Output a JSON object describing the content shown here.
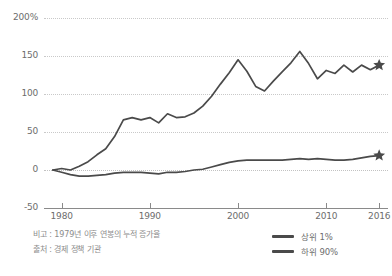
{
  "chart_data": {
    "type": "line",
    "title": "",
    "xlabel": "",
    "ylabel": "",
    "xlim": [
      1978,
      2017
    ],
    "ylim": [
      -50,
      200
    ],
    "grid": true,
    "legend_position": "bottom-right",
    "y_ticks": [
      "200%",
      "150",
      "100",
      "50",
      "0",
      "-50"
    ],
    "y_tick_values": [
      200,
      150,
      100,
      50,
      0,
      -50
    ],
    "x_ticks": [
      "1980",
      "1990",
      "2000",
      "2010",
      "2016"
    ],
    "x_tick_values": [
      1980,
      1990,
      2000,
      2010,
      2016
    ],
    "x": [
      1979,
      1980,
      1981,
      1982,
      1983,
      1984,
      1985,
      1986,
      1987,
      1988,
      1989,
      1990,
      1991,
      1992,
      1993,
      1994,
      1995,
      1996,
      1997,
      1998,
      1999,
      2000,
      2001,
      2002,
      2003,
      2004,
      2005,
      2006,
      2007,
      2008,
      2009,
      2010,
      2011,
      2012,
      2013,
      2014,
      2015,
      2016
    ],
    "series": [
      {
        "name": "상위 1%",
        "color": "#4a4a4a",
        "end_marker": "star",
        "values": [
          0,
          2,
          0,
          5,
          11,
          20,
          28,
          44,
          66,
          69,
          66,
          69,
          62,
          74,
          69,
          70,
          75,
          84,
          97,
          113,
          128,
          145,
          130,
          110,
          104,
          117,
          129,
          141,
          156,
          140,
          120,
          131,
          127,
          138,
          129,
          138,
          132,
          138
        ]
      },
      {
        "name": "하위 90%",
        "color": "#4a4a4a",
        "end_marker": "star",
        "values": [
          0,
          -3,
          -6,
          -8,
          -8,
          -7,
          -6,
          -4,
          -3,
          -3,
          -3,
          -4,
          -5,
          -3,
          -3,
          -2,
          0,
          1,
          4,
          7,
          10,
          12,
          13,
          13,
          13,
          13,
          13,
          14,
          15,
          14,
          15,
          14,
          13,
          13,
          14,
          16,
          18,
          19
        ]
      }
    ],
    "annotations": [
      {
        "name": "note",
        "text": "비고 : 1979년 이후 연봉의 누적 증가율"
      },
      {
        "name": "source",
        "text": "출처 : 경제 정책 기관"
      }
    ]
  },
  "legend": {
    "items": [
      {
        "label": "상위 1%",
        "color": "#4a4a4a"
      },
      {
        "label": "하위 90%",
        "color": "#4a4a4a"
      }
    ]
  },
  "footnotes": {
    "note": "비고 : 1979년 이후 연봉의 누적 증가율",
    "source": "출처 : 경제 정책 기관"
  },
  "colors": {
    "series_line": "#4a4a4a",
    "gridline": "#c9c9c9",
    "axis": "#8a8a8a",
    "tick_text": "#6d6d6d",
    "footnote_text": "#8c8c8c",
    "background": "#ffffff"
  }
}
